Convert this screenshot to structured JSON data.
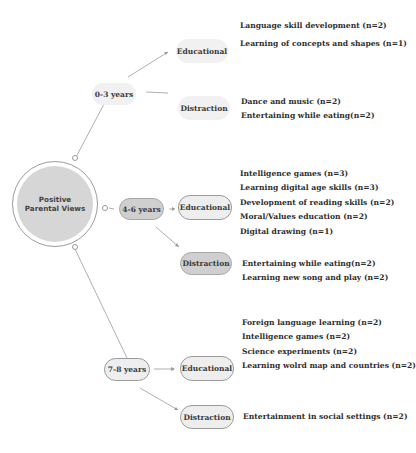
{
  "root": {
    "label_line1": "Positive",
    "label_line2": "Parental Views"
  },
  "groups": [
    {
      "age": "0-3 years",
      "educational": {
        "label": "Educational",
        "items": [
          "Language skill development (n=2)",
          "Learning of concepts and shapes (n=1)"
        ]
      },
      "distraction": {
        "label": "Distraction",
        "items": [
          "Dance and music (n=2)",
          "Entertaining while eating(n=2)"
        ]
      }
    },
    {
      "age": "4-6 years",
      "educational": {
        "label": "Educational",
        "items": [
          "Intelligence games (n=3)",
          "Learning digital age skills (n=3)",
          "Development of reading skills (n=2)",
          "Moral/Values education (n=2)",
          "Digital drawing (n=1)"
        ]
      },
      "distraction": {
        "label": "Distraction",
        "items": [
          "Entertaining while eating(n=2)",
          "Learning new song and play  (n=2)"
        ]
      }
    },
    {
      "age": "7-8 years",
      "educational": {
        "label": "Educational",
        "items": [
          "Foreign language learning (n=2)",
          "Intelligence games (n=2)",
          "Science experiments (n=2)",
          "Learning wolrd map and countries (n=2)"
        ]
      },
      "distraction": {
        "label": "Distraction",
        "items": [
          "Entertainment in social settings  (n=2)"
        ]
      }
    }
  ]
}
